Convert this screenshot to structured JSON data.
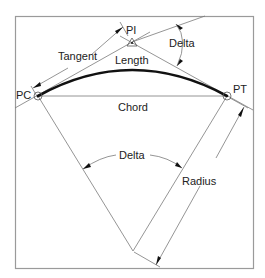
{
  "diagram": {
    "labels": {
      "pi": "PI",
      "pc": "PC",
      "pt": "PT",
      "tangent": "Tangent",
      "length": "Length",
      "chord": "Chord",
      "delta_top": "Delta",
      "delta_center": "Delta",
      "radius": "Radius"
    },
    "colors": {
      "curve": "#111111",
      "lines": "#7a7a7a",
      "frame": "#9a9a9a",
      "background": "#ffffff"
    }
  }
}
